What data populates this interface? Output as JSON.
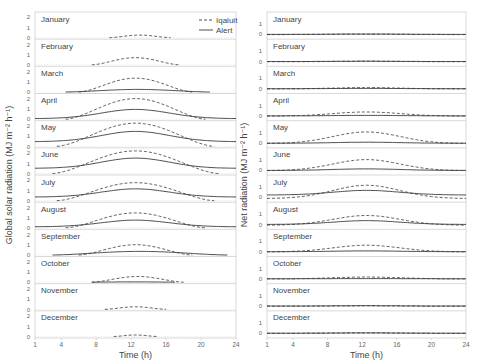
{
  "chart_data": [
    {
      "type": "line",
      "title": "",
      "panel": "left",
      "xlabel": "Time (h)",
      "ylabel": "Global solar radiation (MJ m⁻² h⁻¹)",
      "x_ticks": [
        1,
        4,
        8,
        12,
        16,
        20,
        24
      ],
      "xlim": [
        1,
        24
      ],
      "ylim": [
        0,
        2
      ],
      "y_ticks": [
        0,
        1,
        2
      ],
      "grid": false,
      "legend": {
        "position": "top-right",
        "entries": [
          {
            "name": "Iqaluit",
            "style": "dashed"
          },
          {
            "name": "Alert",
            "style": "solid"
          }
        ]
      },
      "months": [
        {
          "label": "January",
          "iqaluit": {
            "peak": 0.25,
            "start": 9.5,
            "end": 16.5
          },
          "alert": {
            "peak": 0.0,
            "start": 12,
            "end": 12
          }
        },
        {
          "label": "February",
          "iqaluit": {
            "peak": 0.7,
            "start": 7.5,
            "end": 17.5
          },
          "alert": {
            "peak": 0.0,
            "start": 12,
            "end": 12
          }
        },
        {
          "label": "March",
          "iqaluit": {
            "peak": 1.35,
            "start": 6.0,
            "end": 19.0
          },
          "alert": {
            "peak": 0.25,
            "start": 4.5,
            "end": 21.0
          }
        },
        {
          "label": "April",
          "iqaluit": {
            "peak": 2.0,
            "start": 4.5,
            "end": 20.5
          },
          "alert": {
            "peak": 0.95,
            "base": 0.05
          }
        },
        {
          "label": "May",
          "iqaluit": {
            "peak": 2.25,
            "start": 3.5,
            "end": 21.5
          },
          "alert": {
            "peak": 1.45,
            "base": 0.45
          }
        },
        {
          "label": "June",
          "iqaluit": {
            "peak": 2.2,
            "start": 3.0,
            "end": 22.0
          },
          "alert": {
            "peak": 1.5,
            "base": 0.5
          }
        },
        {
          "label": "July",
          "iqaluit": {
            "peak": 1.75,
            "start": 3.5,
            "end": 21.5
          },
          "alert": {
            "peak": 1.15,
            "base": 0.35
          }
        },
        {
          "label": "August",
          "iqaluit": {
            "peak": 1.45,
            "start": 4.5,
            "end": 20.5
          },
          "alert": {
            "peak": 0.75,
            "base": 0.1
          }
        },
        {
          "label": "September",
          "iqaluit": {
            "peak": 1.0,
            "start": 6.0,
            "end": 19.0
          },
          "alert": {
            "peak": 0.35,
            "start": 3.0,
            "end": 23.0
          }
        },
        {
          "label": "October",
          "iqaluit": {
            "peak": 0.55,
            "start": 7.5,
            "end": 18.0
          },
          "alert": {
            "peak": 0.03,
            "start": 7.5,
            "end": 17.0
          }
        },
        {
          "label": "November",
          "iqaluit": {
            "peak": 0.25,
            "start": 9.0,
            "end": 16.0
          },
          "alert": {
            "peak": 0.0,
            "start": 12,
            "end": 12
          }
        },
        {
          "label": "December",
          "iqaluit": {
            "peak": 0.15,
            "start": 10.0,
            "end": 15.0
          },
          "alert": {
            "peak": 0.0,
            "start": 12,
            "end": 12
          }
        }
      ]
    },
    {
      "type": "line",
      "title": "",
      "panel": "right",
      "xlabel": "Time (h)",
      "ylabel": "Net radiation (MJ m⁻² h⁻¹)",
      "x_ticks": [
        1,
        4,
        8,
        12,
        16,
        20,
        24
      ],
      "xlim": [
        1,
        24
      ],
      "ylim": [
        -0.2,
        2
      ],
      "y_ticks": [
        0,
        1
      ],
      "grid": false,
      "months": [
        {
          "label": "January",
          "iqaluit": {
            "peak": 0.0,
            "base": -0.05
          },
          "alert": {
            "peak": 0.0,
            "base": -0.03
          }
        },
        {
          "label": "February",
          "iqaluit": {
            "peak": 0.0,
            "base": -0.05
          },
          "alert": {
            "peak": 0.0,
            "base": -0.03
          }
        },
        {
          "label": "March",
          "iqaluit": {
            "peak": 0.08,
            "base": -0.05
          },
          "alert": {
            "peak": 0.0,
            "base": -0.03
          }
        },
        {
          "label": "April",
          "iqaluit": {
            "peak": 0.35,
            "base": -0.05
          },
          "alert": {
            "peak": 0.02,
            "base": -0.03
          }
        },
        {
          "label": "May",
          "iqaluit": {
            "peak": 1.05,
            "base": -0.08
          },
          "alert": {
            "peak": 0.05,
            "base": -0.05
          }
        },
        {
          "label": "June",
          "iqaluit": {
            "peak": 1.0,
            "base": -0.08
          },
          "alert": {
            "peak": 0.1,
            "base": -0.05
          }
        },
        {
          "label": "July",
          "iqaluit": {
            "peak": 1.15,
            "base": -0.15
          },
          "alert": {
            "peak": 0.65,
            "base": 0.2
          }
        },
        {
          "label": "August",
          "iqaluit": {
            "peak": 0.85,
            "base": -0.1
          },
          "alert": {
            "peak": 0.35,
            "base": -0.02
          }
        },
        {
          "label": "September",
          "iqaluit": {
            "peak": 0.6,
            "base": -0.05
          },
          "alert": {
            "peak": 0.05,
            "base": -0.03
          }
        },
        {
          "label": "October",
          "iqaluit": {
            "peak": 0.15,
            "base": -0.03
          },
          "alert": {
            "peak": 0.0,
            "base": -0.02
          }
        },
        {
          "label": "November",
          "iqaluit": {
            "peak": 0.0,
            "base": -0.05
          },
          "alert": {
            "peak": 0.0,
            "base": -0.03
          }
        },
        {
          "label": "December",
          "iqaluit": {
            "peak": 0.0,
            "base": -0.05
          },
          "alert": {
            "peak": 0.0,
            "base": -0.03
          }
        }
      ]
    }
  ],
  "legend": {
    "iqaluit": "Iqaluit",
    "alert": "Alert"
  },
  "colors": {
    "line": "#3a3a3a",
    "axis": "#cfcfcf",
    "tick_text": "#666666",
    "label_text": "#444444"
  }
}
